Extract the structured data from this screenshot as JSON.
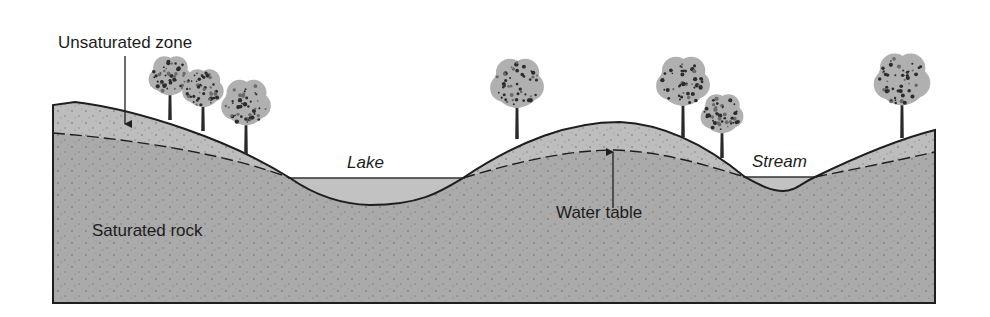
{
  "diagram": {
    "labels": {
      "unsaturated_zone": "Unsaturated zone",
      "lake": "Lake",
      "water_table": "Water table",
      "stream": "Stream",
      "saturated_rock": "Saturated rock"
    },
    "colors": {
      "saturated": "#a9a9a9",
      "unsaturated": "#bdbdbd",
      "water": "#c4c4c4",
      "line": "#1e1e1e",
      "background": "#ffffff"
    },
    "trees": [
      {
        "x": 170,
        "base": 120,
        "height": 62
      },
      {
        "x": 203,
        "base": 131,
        "height": 60
      },
      {
        "x": 246,
        "base": 154,
        "height": 72
      },
      {
        "x": 517,
        "base": 139,
        "height": 78
      },
      {
        "x": 683,
        "base": 137,
        "height": 78
      },
      {
        "x": 722,
        "base": 158,
        "height": 62
      },
      {
        "x": 902,
        "base": 138,
        "height": 82
      }
    ]
  }
}
